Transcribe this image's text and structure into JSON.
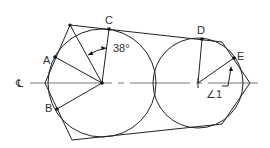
{
  "diagram": {
    "title": "",
    "labels": {
      "A": "A",
      "B": "B",
      "C": "C",
      "D": "D",
      "E": "E",
      "centerline": "℄",
      "angle_value": "38°",
      "angle_1": "∠1"
    },
    "colors": {
      "line": "#222222",
      "text": "#333333",
      "background": "#ffffff"
    },
    "circles": [
      {
        "name": "left-circle",
        "cx": 102,
        "cy": 83,
        "r": 54
      },
      {
        "name": "right-circle",
        "cx": 198,
        "cy": 83,
        "r": 45
      }
    ],
    "points": {
      "A": [
        55,
        57
      ],
      "B": [
        57,
        109
      ],
      "C": [
        109,
        29
      ],
      "D": [
        202,
        39
      ],
      "E": [
        234,
        58
      ]
    }
  }
}
